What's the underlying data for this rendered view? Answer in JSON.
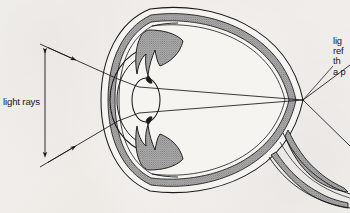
{
  "figure": {
    "background_color": "#f2f0ed",
    "ink_color": "#1a1a1d",
    "shaded_layer_color": "#9a9a9a"
  },
  "labels": {
    "light_rays": "light rays",
    "retina_note_lines": [
      "lig",
      "ref",
      "th",
      "a p"
    ],
    "retina_note_truncated": true
  },
  "anatomy": {
    "parts": [
      "sclera",
      "choroid",
      "retina",
      "cornea",
      "iris",
      "ciliary-body",
      "lens",
      "optic-nerve",
      "focal-point"
    ]
  },
  "optics": {
    "ray_count": 2,
    "ray_arrowheads": 2,
    "bracket_arrowheads": 2,
    "focal_point": {
      "x": 303,
      "y": 100
    },
    "lens_center": {
      "x": 145,
      "y": 100
    }
  }
}
